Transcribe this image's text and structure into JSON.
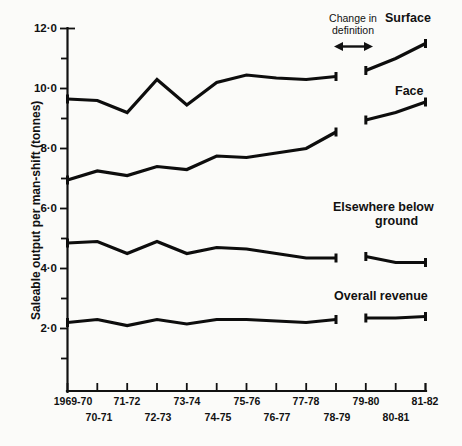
{
  "chart_data": {
    "type": "line",
    "title": "",
    "xlabel": "",
    "ylabel": "Saleable output per man-shift (tonnes)",
    "ylim": [
      0,
      12
    ],
    "yticks": [
      2.0,
      4.0,
      6.0,
      8.0,
      10.0,
      12.0
    ],
    "ytick_labels": [
      "2·0",
      "4·0",
      "6·0",
      "8·0",
      "10·0",
      "12·0"
    ],
    "grid": false,
    "legend_position": "inline-right",
    "categories": [
      "1969-70",
      "70-71",
      "71-72",
      "72-73",
      "73-74",
      "74-75",
      "75-76",
      "76-77",
      "77-78",
      "78-79",
      "79-80",
      "80-81",
      "81-82"
    ],
    "xtick_labels_top": [
      "1969-70",
      "71-72",
      "73-74",
      "75-76",
      "77-78",
      "79-80",
      "81-82"
    ],
    "xtick_labels_bottom": [
      "70-71",
      "72-73",
      "74-75",
      "76-77",
      "78-79",
      "80-81"
    ],
    "series": [
      {
        "name": "Surface",
        "label": "Surface",
        "x": [
          "1969-70",
          "70-71",
          "71-72",
          "72-73",
          "73-74",
          "74-75",
          "75-76",
          "76-77",
          "77-78",
          "78-79"
        ],
        "values": [
          9.65,
          9.6,
          9.2,
          10.3,
          9.45,
          10.2,
          10.45,
          10.35,
          10.3,
          10.4
        ],
        "x2": [
          "79-80",
          "80-81",
          "81-82"
        ],
        "values2": [
          10.6,
          11.0,
          11.5
        ]
      },
      {
        "name": "Face",
        "label": "Face",
        "x": [
          "1969-70",
          "70-71",
          "71-72",
          "72-73",
          "73-74",
          "74-75",
          "75-76",
          "76-77",
          "77-78",
          "78-79"
        ],
        "values": [
          6.95,
          7.25,
          7.1,
          7.4,
          7.3,
          7.75,
          7.7,
          7.85,
          8.0,
          8.55
        ],
        "x2": [
          "79-80",
          "80-81",
          "81-82"
        ],
        "values2": [
          8.95,
          9.2,
          9.55
        ]
      },
      {
        "name": "Elsewhere below ground",
        "label": "Elsewhere below ground",
        "x": [
          "1969-70",
          "70-71",
          "71-72",
          "72-73",
          "73-74",
          "74-75",
          "75-76",
          "76-77",
          "77-78",
          "78-79"
        ],
        "values": [
          4.85,
          4.9,
          4.5,
          4.9,
          4.5,
          4.7,
          4.65,
          4.5,
          4.35,
          4.35
        ],
        "x2": [
          "79-80",
          "80-81",
          "81-82"
        ],
        "values2": [
          4.4,
          4.2,
          4.2
        ]
      },
      {
        "name": "Overall revenue",
        "label": "Overall revenue",
        "x": [
          "1969-70",
          "70-71",
          "71-72",
          "72-73",
          "73-74",
          "74-75",
          "75-76",
          "76-77",
          "77-78",
          "78-79"
        ],
        "values": [
          2.2,
          2.3,
          2.1,
          2.3,
          2.15,
          2.3,
          2.3,
          2.25,
          2.2,
          2.3
        ],
        "x2": [
          "79-80",
          "80-81",
          "81-82"
        ],
        "values2": [
          2.35,
          2.35,
          2.4
        ]
      }
    ],
    "annotations": [
      {
        "name": "change-in-definition",
        "line1": "Change in",
        "line2": "definition"
      }
    ]
  }
}
